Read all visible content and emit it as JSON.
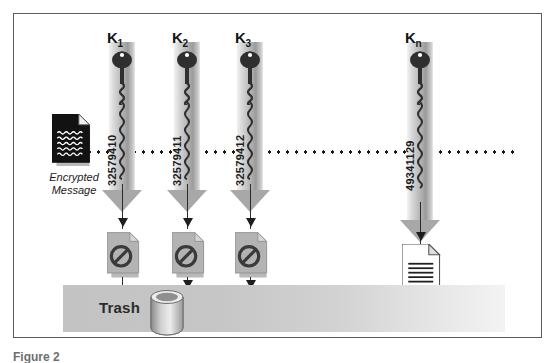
{
  "figure": {
    "caption": "Figure 2",
    "border_color": "#5c5c5c",
    "background": "#ffffff"
  },
  "diagram": {
    "title_concept": "Brute-force key search decryption attempt",
    "dotted_line_label": "encrypted message broadcast line"
  },
  "encrypted_message": {
    "caption": "Encrypted\nMessage",
    "icon": "encrypted-document-icon",
    "fill": "#121212"
  },
  "keys": [
    {
      "label": "K",
      "subscript": "1",
      "digits": "32579410",
      "result": "fail",
      "result_icon": "prohibited-document-icon"
    },
    {
      "label": "K",
      "subscript": "2",
      "digits": "32579411",
      "result": "fail",
      "result_icon": "prohibited-document-icon"
    },
    {
      "label": "K",
      "subscript": "3",
      "digits": "32579412",
      "result": "fail",
      "result_icon": "prohibited-document-icon"
    },
    {
      "label": "K",
      "subscript": "n",
      "digits": "49341129",
      "result": "success",
      "result_icon": "plain-document-icon"
    }
  ],
  "trash": {
    "label": "Trash",
    "icon": "trash-can-icon",
    "bar_color": "#c6c6c6"
  },
  "decrypted_message": {
    "caption": "A Message!",
    "icon": "plain-document-icon",
    "fill": "#ffffff"
  },
  "colors": {
    "arrow_gray": "#a8a8a8",
    "line_dark": "#1e1e1e",
    "doc_gray": "#b3b3b3",
    "shadow": "#b9b9b9"
  }
}
